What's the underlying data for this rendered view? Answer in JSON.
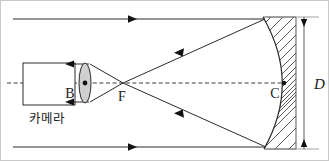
{
  "figure": {
    "kind": "optics-ray-diagram",
    "width": 329,
    "height": 161,
    "background_color": "#ffffff",
    "line_color": "#2b2b2b",
    "lens_fill_color": "#cfcfcf",
    "hatch_color": "#3b3b3b"
  },
  "labels": {
    "camera": "카메라",
    "lens_point": "B",
    "focus_point": "F",
    "mirror_vertex": "C",
    "diameter": "D"
  },
  "parts": {
    "camera_box_name": "camera-body",
    "lens_name": "converging-lens",
    "mirror_name": "concave-mirror",
    "optical_axis_name": "optical-axis",
    "dimension_name": "mirror-diameter-dimension"
  },
  "geometry": {
    "optical_axis_y": 82,
    "incoming_ray_top_y": 18,
    "incoming_ray_bottom_y": 146,
    "incoming_ray_x_start": 12,
    "mirror_top_x": 262,
    "mirror_bottom_x": 263,
    "mirror_vertex_x": 283,
    "focus_x": 122,
    "lens_x": 88,
    "camera_box": {
      "x": 22,
      "y": 62,
      "w": 52,
      "h": 42
    },
    "dimension_x": 303,
    "dimension_top_y": 16,
    "dimension_bottom_y": 148
  },
  "arrows": {
    "incoming_top_marker_x": 133,
    "incoming_bottom_marker_x": 133,
    "converging_upper_marker": "left-down",
    "converging_lower_marker": "left-up",
    "camera_return_marker": "left"
  }
}
